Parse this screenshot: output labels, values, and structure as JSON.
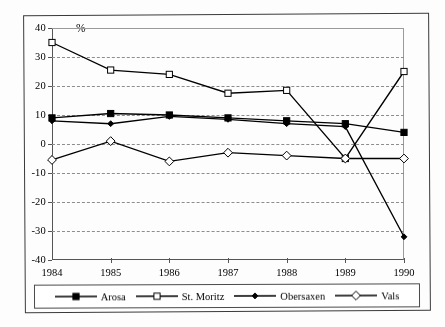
{
  "chart_data": {
    "type": "line",
    "title": "",
    "subtitle": "",
    "xlabel": "",
    "ylabel": "%",
    "categories": [
      "1984",
      "1985",
      "1986",
      "1987",
      "1988",
      "1989",
      "1990"
    ],
    "x": [
      1984,
      1985,
      1986,
      1987,
      1988,
      1989,
      1990
    ],
    "ylim": [
      -40,
      40
    ],
    "ytick_labels": [
      "40",
      "30",
      "20",
      "10",
      "0",
      "-10",
      "-20",
      "-30",
      "-40"
    ],
    "ytick_values": [
      40,
      30,
      20,
      10,
      0,
      -10,
      -20,
      -30,
      -40
    ],
    "ytick_step": 10,
    "grid": true,
    "grid_style": "dashed-horizontal",
    "legend_position": "below",
    "series": [
      {
        "name": "Arosa",
        "marker": "filled-square",
        "color": "#000000",
        "values": [
          9,
          10.5,
          10,
          9,
          8,
          7,
          4
        ]
      },
      {
        "name": "St. Moritz",
        "marker": "open-square",
        "color": "#000000",
        "values": [
          35,
          25.5,
          24,
          17.5,
          18.5,
          -5,
          25
        ]
      },
      {
        "name": "Obersaxen",
        "marker": "filled-diamond",
        "color": "#000000",
        "values": [
          8,
          7,
          9.5,
          8.5,
          7,
          6,
          -32
        ]
      },
      {
        "name": "Vals",
        "marker": "open-diamond",
        "color": "#000000",
        "values": [
          -5.5,
          1,
          -6,
          -3,
          -4,
          -5,
          -5
        ]
      }
    ]
  },
  "legend": {
    "items": [
      {
        "label": "Arosa",
        "marker": "filled-square"
      },
      {
        "label": "St. Moritz",
        "marker": "open-square"
      },
      {
        "label": "Obersaxen",
        "marker": "filled-diamond"
      },
      {
        "label": "Vals",
        "marker": "open-diamond"
      }
    ]
  }
}
